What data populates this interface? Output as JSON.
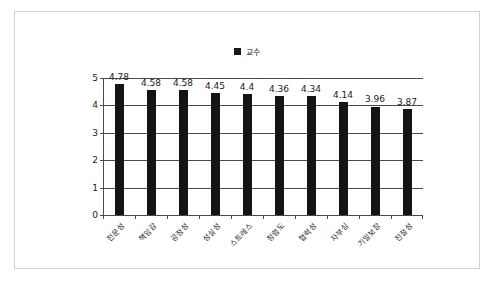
{
  "chart_data": {
    "type": "bar",
    "title": "",
    "xlabel": "",
    "ylabel": "",
    "ylim": [
      0,
      5
    ],
    "yticks": [
      0,
      1,
      2,
      3,
      4,
      5
    ],
    "grid": true,
    "legend_position": "top-center",
    "legend": [
      "교수"
    ],
    "categories": [
      "전문성",
      "책임감",
      "공정성",
      "성실성",
      "스트레스",
      "청렴도",
      "협력성",
      "자부심",
      "기밀보장",
      "친절성"
    ],
    "series": [
      {
        "name": "교수",
        "color": "#141414",
        "values": [
          4.78,
          4.58,
          4.58,
          4.45,
          4.4,
          4.36,
          4.34,
          4.14,
          3.96,
          3.87
        ],
        "value_labels": [
          "4.78",
          "4.58",
          "4.58",
          "4.45",
          "4.4",
          "4.36",
          "4.34",
          "4.14",
          "3.96",
          "3.87"
        ]
      }
    ]
  },
  "legend": {
    "marker": "square-marker",
    "label": "교수"
  },
  "axis": {
    "y_tick_labels": [
      "5",
      "4",
      "3",
      "2",
      "1",
      "0"
    ]
  },
  "colors": {
    "bar": "#141414",
    "axis": "#4a4a4a",
    "frame": "#d2d2d2",
    "background": "#ffffff"
  }
}
